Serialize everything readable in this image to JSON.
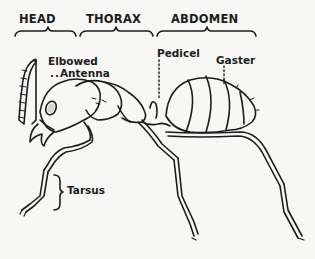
{
  "diagram": {
    "regions": [
      {
        "id": "head",
        "label": "HEAD"
      },
      {
        "id": "thorax",
        "label": "THORAX"
      },
      {
        "id": "abdomen",
        "label": "ABDOMEN"
      }
    ],
    "parts": {
      "antenna": {
        "line1": "Elbowed",
        "line2": "Antenna"
      },
      "pedicel": "Pedicel",
      "gaster": "Gaster",
      "tarsus": "Tarsus"
    },
    "colors": {
      "ink": "#1c1c1c",
      "paper": "#f7f7f5"
    }
  }
}
